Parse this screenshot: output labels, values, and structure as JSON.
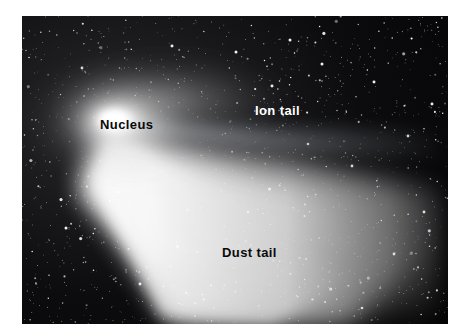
{
  "figure": {
    "kind": "annotated-astrophotograph",
    "background_color": "#ffffff",
    "plate": {
      "sky_color": "#050506",
      "left": 22,
      "top": 16,
      "width": 426,
      "height": 308
    }
  },
  "labels": [
    {
      "id": "nucleus",
      "text": "Nucleus",
      "color": "#0a0a0a",
      "style": "dark",
      "x": 100,
      "y": 118
    },
    {
      "id": "ion-tail",
      "text": "Ion tail",
      "color": "#ffffff",
      "style": "light",
      "x": 255,
      "y": 104
    },
    {
      "id": "dust-tail",
      "text": "Dust tail",
      "color": "#0a0a0a",
      "style": "dark",
      "x": 222,
      "y": 246
    }
  ],
  "features": {
    "nucleus": {
      "name": "Nucleus",
      "description": "bright compact coma core",
      "center_x": 112,
      "center_y": 120,
      "color": "#ffffff"
    },
    "ion_tail": {
      "name": "Ion tail",
      "description": "narrow faint straight streak trailing to the right",
      "color": "#9aa2ad"
    },
    "dust_tail": {
      "name": "Dust tail",
      "description": "broad bright curved fan sweeping to the lower right",
      "color": "#f2f2f2"
    },
    "star_field": {
      "name": "Star field",
      "description": "dense scattering of white point stars across the dark sky",
      "color": "#ffffff"
    }
  }
}
